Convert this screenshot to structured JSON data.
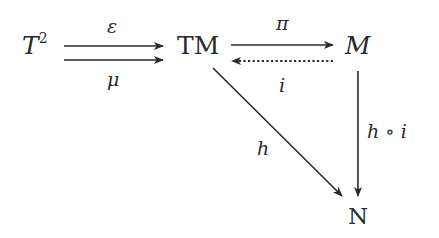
{
  "diagram": {
    "type": "commutative-diagram",
    "nodes": {
      "t2": {
        "base": "T",
        "sup": "2"
      },
      "tm": {
        "label": "TM"
      },
      "m": {
        "label": "M"
      },
      "n": {
        "label": "N"
      }
    },
    "edges": {
      "epsilon": {
        "from": "T²",
        "to": "TM",
        "label": "ε",
        "style": "solid"
      },
      "mu": {
        "from": "T²",
        "to": "TM",
        "label": "μ",
        "style": "solid"
      },
      "pi": {
        "from": "TM",
        "to": "M",
        "label": "π",
        "style": "solid"
      },
      "i": {
        "from": "M",
        "to": "TM",
        "label": "i",
        "style": "dotted"
      },
      "h": {
        "from": "TM",
        "to": "N",
        "label": "h",
        "style": "solid"
      },
      "hoi": {
        "from": "M",
        "to": "N",
        "label": "h ∘ i",
        "style": "solid"
      }
    },
    "colors": {
      "ink": "#2a2a2a",
      "background": "#ffffff"
    }
  }
}
